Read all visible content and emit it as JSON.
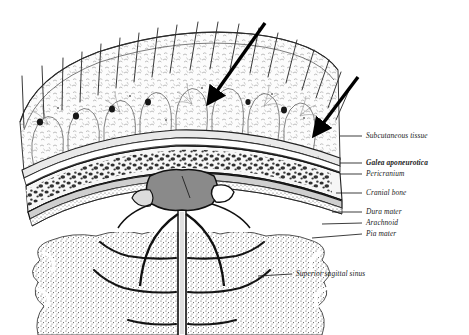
{
  "figure": {
    "background_color": "#ffffff",
    "ink_color": "#1b1b1b",
    "sinus_fill": "#8a8a8a",
    "stipple_color": "#4a4a4a"
  },
  "labels": [
    {
      "id": "subcutaneous-tissue",
      "text": "Subcutaneous tissue",
      "bold": false,
      "x": 366,
      "y": 132,
      "leader": {
        "x1": 340,
        "y1": 136,
        "x2": 362,
        "y2": 136
      }
    },
    {
      "id": "galea-aponeurotica",
      "text": "Galea aponeurotica",
      "bold": true,
      "x": 366,
      "y": 159,
      "leader": {
        "x1": 340,
        "y1": 163,
        "x2": 362,
        "y2": 163
      }
    },
    {
      "id": "pericranium",
      "text": "Pericranium",
      "bold": false,
      "x": 366,
      "y": 170,
      "leader": {
        "x1": 340,
        "y1": 174,
        "x2": 362,
        "y2": 174
      }
    },
    {
      "id": "cranial-bone",
      "text": "Cranial bone",
      "bold": false,
      "x": 366,
      "y": 189,
      "leader": {
        "x1": 336,
        "y1": 193,
        "x2": 362,
        "y2": 193
      }
    },
    {
      "id": "dura-mater",
      "text": "Dura mater",
      "bold": false,
      "x": 366,
      "y": 208,
      "leader": {
        "x1": 332,
        "y1": 212,
        "x2": 362,
        "y2": 212
      }
    },
    {
      "id": "arachnoid",
      "text": "Arachnoid",
      "bold": false,
      "x": 366,
      "y": 219,
      "leader": {
        "x1": 322,
        "y1": 224,
        "x2": 362,
        "y2": 223
      }
    },
    {
      "id": "pia-mater",
      "text": "Pia mater",
      "bold": false,
      "x": 366,
      "y": 230,
      "leader": {
        "x1": 312,
        "y1": 238,
        "x2": 362,
        "y2": 234
      }
    },
    {
      "id": "superior-sagittal-sinus",
      "text": "Superior sagittal sinus",
      "bold": false,
      "x": 296,
      "y": 270,
      "leader": {
        "x1": 258,
        "y1": 276,
        "x2": 292,
        "y2": 274
      }
    }
  ],
  "arrows": [
    {
      "id": "arrow-upper",
      "x1": 265,
      "y1": 23,
      "x2": 212,
      "y2": 98
    },
    {
      "id": "arrow-lower",
      "x1": 358,
      "y1": 77,
      "x2": 318,
      "y2": 130
    }
  ],
  "layers": [
    {
      "id": "hair",
      "name": "Hair shafts"
    },
    {
      "id": "skin",
      "name": "Skin"
    },
    {
      "id": "subcutaneous",
      "name": "Subcutaneous tissue"
    },
    {
      "id": "galea",
      "name": "Galea aponeurotica"
    },
    {
      "id": "pericranium",
      "name": "Pericranium"
    },
    {
      "id": "diploe",
      "name": "Diploë of cranial bone"
    },
    {
      "id": "dura",
      "name": "Dura mater"
    },
    {
      "id": "arachnoid",
      "name": "Arachnoid"
    },
    {
      "id": "pia",
      "name": "Pia mater"
    },
    {
      "id": "sinus",
      "name": "Superior sagittal sinus"
    },
    {
      "id": "falx",
      "name": "Falx cerebri"
    },
    {
      "id": "cortex",
      "name": "Cerebral cortex"
    }
  ]
}
